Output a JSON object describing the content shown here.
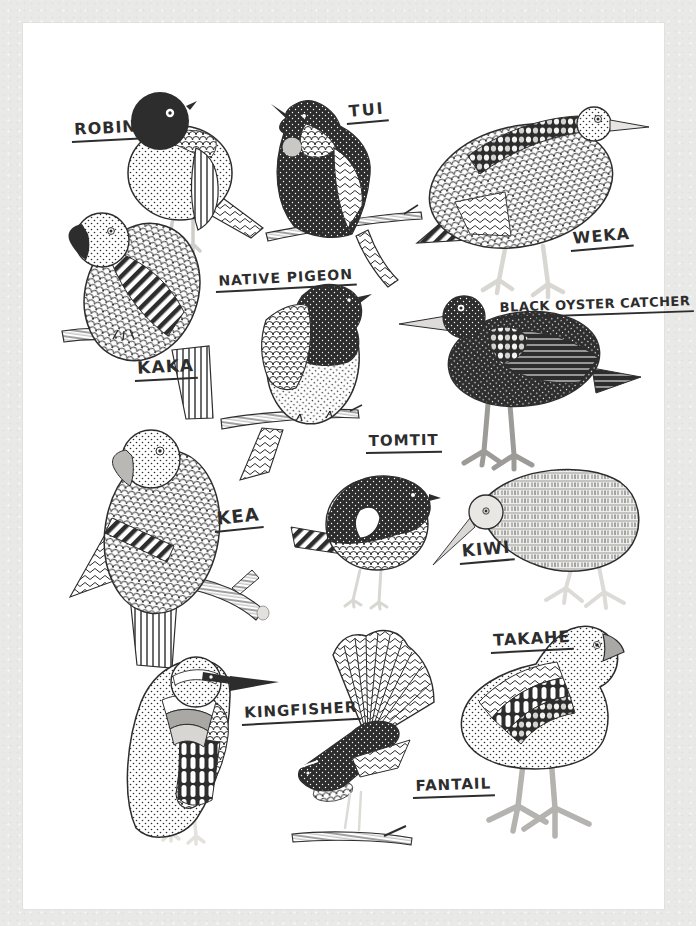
{
  "colors": {
    "wall": "#e9e9e7",
    "paper": "#ffffff",
    "ink": "#2d2d2d",
    "soft_gray": "#c9c8c4",
    "mid_gray": "#9c9b97",
    "leg_gray": "#d8d7d2"
  },
  "birds": [
    {
      "id": "robin",
      "label": "ROBIN"
    },
    {
      "id": "tui",
      "label": "TUI"
    },
    {
      "id": "weka",
      "label": "WEKA"
    },
    {
      "id": "kaka",
      "label": "KAKA"
    },
    {
      "id": "native-pigeon",
      "label": "NATIVE PIGEON"
    },
    {
      "id": "black-oyster-catcher",
      "label": "BLACK OYSTER CATCHER"
    },
    {
      "id": "kea",
      "label": "KEA"
    },
    {
      "id": "tomtit",
      "label": "TOMTIT"
    },
    {
      "id": "kiwi",
      "label": "KIWI"
    },
    {
      "id": "kingfisher",
      "label": "KINGFISHER"
    },
    {
      "id": "fantail",
      "label": "FANTAIL"
    },
    {
      "id": "takahe",
      "label": "TAKAHE"
    }
  ]
}
